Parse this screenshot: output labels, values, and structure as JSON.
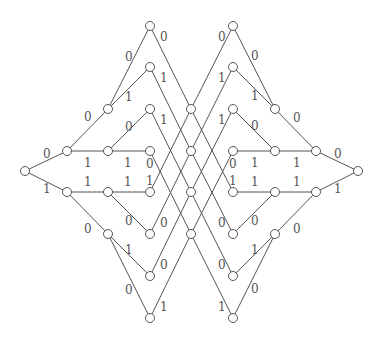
{
  "diagram": {
    "type": "network",
    "colors": {
      "line": "#555555",
      "node_fill": "#ffffff",
      "text": "#555555"
    },
    "node_radius": 4.5,
    "nodes": [
      {
        "id": "a0",
        "x": 25,
        "y": 171
      },
      {
        "id": "b0",
        "x": 67,
        "y": 151
      },
      {
        "id": "b1",
        "x": 67,
        "y": 192
      },
      {
        "id": "c0",
        "x": 108,
        "y": 109
      },
      {
        "id": "c1",
        "x": 108,
        "y": 151
      },
      {
        "id": "c2",
        "x": 108,
        "y": 192
      },
      {
        "id": "c3",
        "x": 108,
        "y": 234
      },
      {
        "id": "d0",
        "x": 150,
        "y": 26
      },
      {
        "id": "d1",
        "x": 150,
        "y": 67
      },
      {
        "id": "d2",
        "x": 150,
        "y": 109
      },
      {
        "id": "d3",
        "x": 150,
        "y": 151
      },
      {
        "id": "d4",
        "x": 150,
        "y": 192
      },
      {
        "id": "d5",
        "x": 150,
        "y": 234
      },
      {
        "id": "d6",
        "x": 150,
        "y": 276
      },
      {
        "id": "d7",
        "x": 150,
        "y": 318
      },
      {
        "id": "e0",
        "x": 191,
        "y": 109
      },
      {
        "id": "e1",
        "x": 191,
        "y": 151
      },
      {
        "id": "e2",
        "x": 191,
        "y": 192
      },
      {
        "id": "e3",
        "x": 191,
        "y": 234
      },
      {
        "id": "f0",
        "x": 233,
        "y": 26
      },
      {
        "id": "f1",
        "x": 233,
        "y": 67
      },
      {
        "id": "f2",
        "x": 233,
        "y": 109
      },
      {
        "id": "f3",
        "x": 233,
        "y": 151
      },
      {
        "id": "f4",
        "x": 233,
        "y": 192
      },
      {
        "id": "f5",
        "x": 233,
        "y": 234
      },
      {
        "id": "f6",
        "x": 233,
        "y": 276
      },
      {
        "id": "f7",
        "x": 233,
        "y": 318
      },
      {
        "id": "g0",
        "x": 275,
        "y": 109
      },
      {
        "id": "g1",
        "x": 275,
        "y": 151
      },
      {
        "id": "g2",
        "x": 275,
        "y": 192
      },
      {
        "id": "g3",
        "x": 275,
        "y": 234
      },
      {
        "id": "h0",
        "x": 316,
        "y": 151
      },
      {
        "id": "h1",
        "x": 316,
        "y": 192
      },
      {
        "id": "i0",
        "x": 358,
        "y": 171
      }
    ],
    "edges": [
      [
        "a0",
        "b0"
      ],
      [
        "a0",
        "b1"
      ],
      [
        "b0",
        "c0"
      ],
      [
        "b0",
        "c1"
      ],
      [
        "b1",
        "c2"
      ],
      [
        "b1",
        "c3"
      ],
      [
        "c0",
        "d0"
      ],
      [
        "c0",
        "d1"
      ],
      [
        "c1",
        "d2"
      ],
      [
        "c1",
        "d3"
      ],
      [
        "c2",
        "d4"
      ],
      [
        "c2",
        "d5"
      ],
      [
        "c3",
        "d6"
      ],
      [
        "c3",
        "d7"
      ],
      [
        "d0",
        "e0"
      ],
      [
        "d1",
        "e1"
      ],
      [
        "d2",
        "e2"
      ],
      [
        "d3",
        "e3"
      ],
      [
        "d4",
        "e0"
      ],
      [
        "d5",
        "e1"
      ],
      [
        "d6",
        "e2"
      ],
      [
        "d7",
        "e3"
      ],
      [
        "e0",
        "f0"
      ],
      [
        "e1",
        "f1"
      ],
      [
        "e2",
        "f2"
      ],
      [
        "e3",
        "f3"
      ],
      [
        "e0",
        "f4"
      ],
      [
        "e1",
        "f5"
      ],
      [
        "e2",
        "f6"
      ],
      [
        "e3",
        "f7"
      ],
      [
        "f0",
        "g0"
      ],
      [
        "f1",
        "g0"
      ],
      [
        "f2",
        "g1"
      ],
      [
        "f3",
        "g1"
      ],
      [
        "f4",
        "g2"
      ],
      [
        "f5",
        "g2"
      ],
      [
        "f6",
        "g3"
      ],
      [
        "f7",
        "g3"
      ],
      [
        "g0",
        "h0"
      ],
      [
        "g1",
        "h0"
      ],
      [
        "g2",
        "h1"
      ],
      [
        "g3",
        "h1"
      ],
      [
        "h0",
        "i0"
      ],
      [
        "h1",
        "i0"
      ]
    ],
    "labels": [
      {
        "text": "0",
        "x": 43,
        "y": 158
      },
      {
        "text": "1",
        "x": 43,
        "y": 193
      },
      {
        "text": "0",
        "x": 84,
        "y": 121
      },
      {
        "text": "1",
        "x": 84,
        "y": 167
      },
      {
        "text": "1",
        "x": 84,
        "y": 186
      },
      {
        "text": "0",
        "x": 84,
        "y": 233
      },
      {
        "text": "0",
        "x": 125,
        "y": 61
      },
      {
        "text": "1",
        "x": 125,
        "y": 101
      },
      {
        "text": "0",
        "x": 125,
        "y": 131
      },
      {
        "text": "1",
        "x": 124,
        "y": 167
      },
      {
        "text": "1",
        "x": 124,
        "y": 186
      },
      {
        "text": "0",
        "x": 125,
        "y": 225
      },
      {
        "text": "1",
        "x": 125,
        "y": 254
      },
      {
        "text": "0",
        "x": 125,
        "y": 294
      },
      {
        "text": "0",
        "x": 160,
        "y": 41
      },
      {
        "text": "1",
        "x": 160,
        "y": 82
      },
      {
        "text": "1",
        "x": 160,
        "y": 124
      },
      {
        "text": "0",
        "x": 146,
        "y": 168
      },
      {
        "text": "1",
        "x": 146,
        "y": 185
      },
      {
        "text": "0",
        "x": 160,
        "y": 227
      },
      {
        "text": "0",
        "x": 160,
        "y": 269
      },
      {
        "text": "1",
        "x": 160,
        "y": 311
      },
      {
        "text": "0",
        "x": 218,
        "y": 41
      },
      {
        "text": "1",
        "x": 218,
        "y": 82
      },
      {
        "text": "1",
        "x": 218,
        "y": 124
      },
      {
        "text": "0",
        "x": 229,
        "y": 168
      },
      {
        "text": "1",
        "x": 229,
        "y": 185
      },
      {
        "text": "0",
        "x": 218,
        "y": 227
      },
      {
        "text": "0",
        "x": 218,
        "y": 269
      },
      {
        "text": "1",
        "x": 218,
        "y": 311
      },
      {
        "text": "0",
        "x": 251,
        "y": 60
      },
      {
        "text": "1",
        "x": 251,
        "y": 100
      },
      {
        "text": "0",
        "x": 251,
        "y": 130
      },
      {
        "text": "1",
        "x": 251,
        "y": 167
      },
      {
        "text": "1",
        "x": 251,
        "y": 186
      },
      {
        "text": "0",
        "x": 251,
        "y": 225
      },
      {
        "text": "1",
        "x": 251,
        "y": 254
      },
      {
        "text": "0",
        "x": 251,
        "y": 293
      },
      {
        "text": "0",
        "x": 293,
        "y": 122
      },
      {
        "text": "1",
        "x": 293,
        "y": 167
      },
      {
        "text": "1",
        "x": 293,
        "y": 186
      },
      {
        "text": "0",
        "x": 293,
        "y": 233
      },
      {
        "text": "0",
        "x": 334,
        "y": 158
      },
      {
        "text": "1",
        "x": 334,
        "y": 193
      }
    ]
  }
}
